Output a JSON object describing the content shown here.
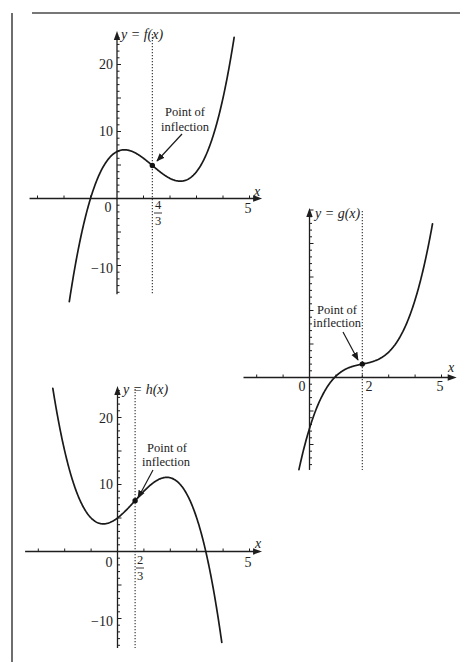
{
  "chart_data": [
    {
      "id": "f",
      "type": "line",
      "title": "",
      "function": "f(x) = x^3 - 4x^2 + 2x + 7",
      "coefficients": [
        1,
        -4,
        2,
        7
      ],
      "x_range": [
        -1.8,
        4.43
      ],
      "xlabel": "x",
      "ylabel": "y = f(x)",
      "xlim": [
        -3.3,
        5.4
      ],
      "ylim": [
        -14.3,
        24.7
      ],
      "grid": false,
      "x_tick_labels": {
        "origin": "0",
        "inflection_num": "4",
        "inflection_den": "3",
        "five": "5"
      },
      "y_tick_labels": {
        "twenty": "20",
        "ten": "10",
        "minus_ten": "−10"
      },
      "inflection_point": {
        "x": 1.3333,
        "y": 4.93,
        "label_line1": "Point of",
        "label_line2": "inflection"
      },
      "local_max": {
        "x": 0.28,
        "y": 7.27
      },
      "local_min": {
        "x": 2.39,
        "y": 2.58
      },
      "points": [
        [
          -1.8,
          -15.39
        ],
        [
          -1.5,
          -8.38
        ],
        [
          -1,
          0
        ],
        [
          -0.5,
          4.88
        ],
        [
          0,
          7
        ],
        [
          0.28,
          7.27
        ],
        [
          0.5,
          7.13
        ],
        [
          1,
          6
        ],
        [
          1.333,
          4.93
        ],
        [
          1.5,
          4.38
        ],
        [
          2,
          3
        ],
        [
          2.39,
          2.58
        ],
        [
          2.5,
          2.63
        ],
        [
          3,
          4
        ],
        [
          3.5,
          7.88
        ],
        [
          4,
          15
        ],
        [
          4.43,
          24.3
        ]
      ]
    },
    {
      "id": "g",
      "type": "line",
      "title": "",
      "function": "g(x) = (x - 2)^3 + 0.8(x - 2) + 2",
      "coefficients": [
        1,
        -6,
        12.8,
        -7.6
      ],
      "x_range": [
        -0.4,
        4.66
      ],
      "xlabel": "x",
      "ylabel": "y = g(x)",
      "xlim": [
        -2.5,
        5.5
      ],
      "ylim": [
        -13.8,
        25
      ],
      "grid": false,
      "x_tick_labels": {
        "origin": "0",
        "inflection": "2",
        "five": "5"
      },
      "inflection_point": {
        "x": 2,
        "y": 2,
        "label_line1": "Point of",
        "label_line2": "inflection"
      },
      "points": [
        [
          -0.4,
          -13.74
        ],
        [
          0,
          -7.6
        ],
        [
          0.5,
          -2.58
        ],
        [
          1,
          0.2
        ],
        [
          1.5,
          1.48
        ],
        [
          2,
          2
        ],
        [
          2.5,
          2.53
        ],
        [
          3,
          3.8
        ],
        [
          3.5,
          6.58
        ],
        [
          4,
          11.6
        ],
        [
          4.5,
          19.63
        ],
        [
          4.66,
          22.95
        ]
      ]
    },
    {
      "id": "h",
      "type": "line",
      "title": "",
      "function": "h(x) = -x^3 + 2x^2 + 3x + 5",
      "coefficients": [
        -1,
        2,
        3,
        5
      ],
      "x_range": [
        -2.45,
        3.95
      ],
      "xlabel": "x",
      "ylabel": "y = h(x)",
      "xlim": [
        -3.5,
        5.4
      ],
      "ylim": [
        -14.4,
        24.4
      ],
      "grid": false,
      "x_tick_labels": {
        "origin": "0",
        "inflection_num": "2",
        "inflection_den": "3",
        "five": "5"
      },
      "y_tick_labels": {
        "twenty": "20",
        "ten": "10",
        "minus_ten": "−10"
      },
      "inflection_point": {
        "x": 0.6667,
        "y": 7.59,
        "label_line1": "Point of",
        "label_line2": "inflection"
      },
      "local_min": {
        "x": -0.535,
        "y": 4.12
      },
      "local_max": {
        "x": 1.87,
        "y": 11.07
      },
      "points": [
        [
          -2.45,
          24.36
        ],
        [
          -2,
          15
        ],
        [
          -1.5,
          8.38
        ],
        [
          -1,
          5
        ],
        [
          -0.535,
          4.12
        ],
        [
          0,
          5
        ],
        [
          0.667,
          7.59
        ],
        [
          1,
          9
        ],
        [
          1.5,
          10.63
        ],
        [
          1.87,
          11.07
        ],
        [
          2,
          11
        ],
        [
          2.5,
          9.38
        ],
        [
          3,
          5
        ],
        [
          3.34,
          0.07
        ],
        [
          3.5,
          -2.88
        ],
        [
          3.95,
          -13.57
        ]
      ]
    }
  ]
}
